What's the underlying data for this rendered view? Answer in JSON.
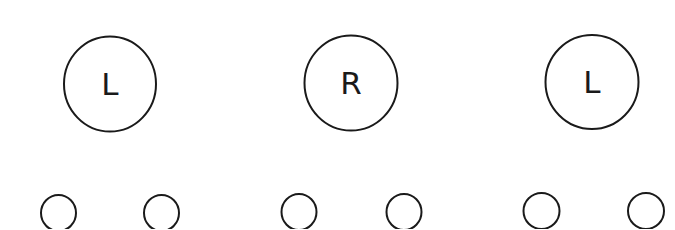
{
  "diagram": {
    "nodes": [
      {
        "label": "L",
        "children": 2
      },
      {
        "label": "R",
        "children": 2
      },
      {
        "label": "L",
        "children": 2
      }
    ],
    "stroke_color": "#1a1a1a",
    "background": "#ffffff"
  }
}
